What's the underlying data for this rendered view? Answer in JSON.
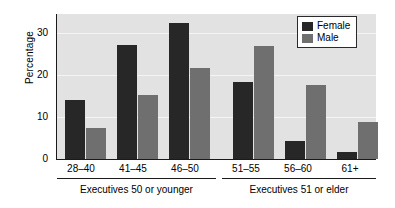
{
  "chart_data": {
    "type": "bar",
    "title": "",
    "xlabel": "",
    "ylabel": "Percentage",
    "ylim": [
      0,
      35
    ],
    "yticks": [
      0,
      10,
      20,
      30
    ],
    "grid": true,
    "legend_position": "top-right",
    "categories": [
      "28–40",
      "41–45",
      "46–50",
      "51–55",
      "56–60",
      "61+"
    ],
    "series": [
      {
        "name": "Female",
        "color": "#272727",
        "values": [
          14.2,
          27.3,
          32.7,
          18.4,
          4.2,
          1.8
        ]
      },
      {
        "name": "Male",
        "color": "#6f6f6f",
        "values": [
          7.4,
          15.3,
          21.7,
          27.0,
          17.7,
          8.8
        ]
      }
    ],
    "groups": [
      {
        "label": "Executives 50 or younger",
        "categories": [
          "28–40",
          "41–45",
          "46–50"
        ]
      },
      {
        "label": "Executives 51 or elder",
        "categories": [
          "51–55",
          "56–60",
          "61+"
        ]
      }
    ],
    "plot_background": "#e2e2e2",
    "gridline_color": "#f4f4f4",
    "axis_color": "#1a1a1a"
  },
  "yticklabels": {
    "t0": "0",
    "t10": "10",
    "t20": "20",
    "t30": "30"
  },
  "axis": {
    "ylabel": "Percentage"
  },
  "legend": {
    "female": "Female",
    "male": "Male"
  },
  "xticks": {
    "c0": "28–40",
    "c1": "41–45",
    "c2": "46–50",
    "c3": "51–55",
    "c4": "56–60",
    "c5": "61+"
  },
  "groups": {
    "g0": "Executives 50 or younger",
    "g1": "Executives 51 or elder"
  }
}
